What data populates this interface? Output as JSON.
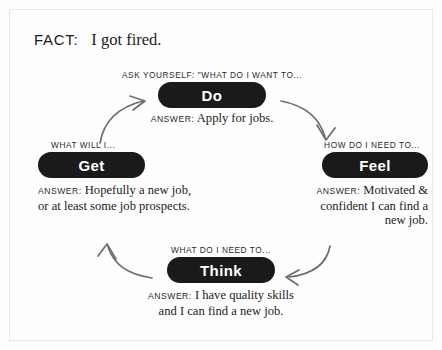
{
  "fact": {
    "label": "FACT:",
    "text": "I got fired."
  },
  "nodes": {
    "do": {
      "caption": "ASK YOURSELF: \"WHAT DO I WANT TO...",
      "pill_label": "Do",
      "answer_label": "ANSWER:",
      "answer_lines": [
        "Apply for jobs."
      ]
    },
    "get": {
      "caption": "WHAT WILL I...",
      "pill_label": "Get",
      "answer_label": "ANSWER:",
      "answer_lines": [
        "Hopefully a new job,",
        "or at least some job prospects."
      ]
    },
    "feel": {
      "caption": "HOW DO I NEED TO...",
      "pill_label": "Feel",
      "answer_label": "ANSWER:",
      "answer_lines": [
        "Motivated &",
        "confident I can find a",
        "new job."
      ]
    },
    "think": {
      "caption": "WHAT DO I NEED TO...",
      "pill_label": "Think",
      "answer_label": "ANSWER:",
      "answer_lines": [
        "I have quality skills",
        "and I can find a new job."
      ]
    }
  },
  "arrows": [
    {
      "name": "arrow-get-to-do",
      "from": "Get",
      "to": "Do"
    },
    {
      "name": "arrow-do-to-feel",
      "from": "Do",
      "to": "Feel"
    },
    {
      "name": "arrow-feel-to-think",
      "from": "Feel",
      "to": "Think"
    },
    {
      "name": "arrow-think-to-get",
      "from": "Think",
      "to": "Get"
    }
  ],
  "colors": {
    "pill_background": "#1a1a1a",
    "pill_text": "#ffffff",
    "body_text": "#1b1b1b",
    "arrow": "#6d6d6d",
    "page_background": "#fdfdfd",
    "frame_border": "#e8e8e8"
  }
}
